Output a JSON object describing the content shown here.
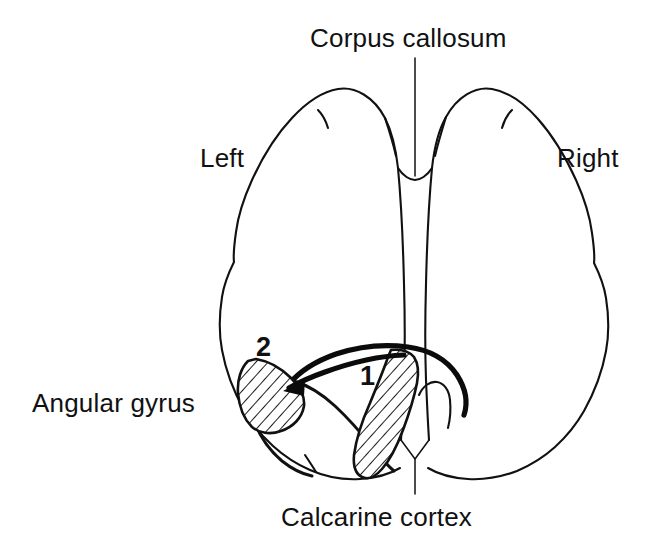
{
  "figure": {
    "title_alt": "Dorsal view schematic of the cerebral hemispheres",
    "background_color": "#ffffff",
    "ink_color": "#111111"
  },
  "labels": {
    "corpus_callosum": "Corpus callosum",
    "left": "Left",
    "right": "Right",
    "angular_gyrus": "Angular gyrus",
    "calcarine_cortex": "Calcarine cortex"
  },
  "markers": {
    "one": "1",
    "two": "2"
  },
  "regions": [
    {
      "id": "1",
      "name": "calcarine-cortex-region",
      "fill": "hatched",
      "description": "Elongated hatched band adjacent to the midline in the left occipital lobe"
    },
    {
      "id": "2",
      "name": "angular-gyrus-region",
      "fill": "hatched",
      "description": "Lens shaped hatched region on the lateral left occipito-parietal border"
    }
  ],
  "leaders": [
    {
      "name": "corpus-callosum-leader",
      "from_label": "Corpus callosum",
      "orientation": "vertical"
    },
    {
      "name": "calcarine-cortex-leader",
      "from_label": "Calcarine cortex",
      "orientation": "vertical-with-fork"
    },
    {
      "name": "angular-gyrus-arrow",
      "from_label": "Angular gyrus",
      "orientation": "arc-with-arrowhead"
    }
  ]
}
